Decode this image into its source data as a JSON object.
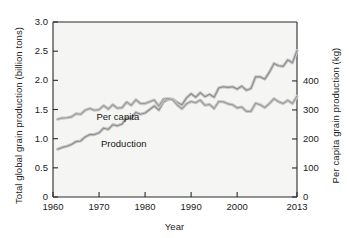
{
  "chart_data": {
    "type": "line",
    "title": "",
    "xlabel": "Year",
    "ylabel": "Total global grain production (billion tons)",
    "ylabel_right": "Per capita grain production (kg)",
    "xlim": [
      1960,
      2013
    ],
    "ylim": [
      0,
      3.0
    ],
    "ylim_right": [
      0,
      603
    ],
    "grid": false,
    "legend_position": "inline-annotation",
    "xticks": [
      1960,
      1970,
      1980,
      1990,
      2000,
      2013
    ],
    "xtick_labels": [
      "1960",
      "1970",
      "1980",
      "1990",
      "2000",
      "2013"
    ],
    "yticks_left": [
      0,
      0.5,
      1.0,
      1.5,
      2.0,
      2.5,
      3.0
    ],
    "ytick_labels_left": [
      "0",
      "0.5",
      "1.0",
      "1.5",
      "2.0",
      "2.5",
      "3.0"
    ],
    "yticks_right": [
      0,
      100,
      200,
      300,
      400
    ],
    "ytick_labels_right": [
      "0",
      "100",
      "200",
      "300",
      "400"
    ],
    "series": [
      {
        "name": "Production",
        "label": "Production",
        "axis": "left",
        "units": "billion tons",
        "color": "#8c8c8c",
        "x": [
          1961,
          1962,
          1963,
          1964,
          1965,
          1966,
          1967,
          1968,
          1969,
          1970,
          1971,
          1972,
          1973,
          1974,
          1975,
          1976,
          1977,
          1978,
          1979,
          1980,
          1981,
          1982,
          1983,
          1984,
          1985,
          1986,
          1987,
          1988,
          1989,
          1990,
          1991,
          1992,
          1993,
          1994,
          1995,
          1996,
          1997,
          1998,
          1999,
          2000,
          2001,
          2002,
          2003,
          2004,
          2005,
          2006,
          2007,
          2008,
          2009,
          2010,
          2011,
          2012,
          2013
        ],
        "values": [
          0.82,
          0.85,
          0.87,
          0.9,
          0.95,
          0.96,
          1.03,
          1.07,
          1.07,
          1.1,
          1.18,
          1.16,
          1.24,
          1.22,
          1.25,
          1.36,
          1.34,
          1.45,
          1.42,
          1.44,
          1.5,
          1.56,
          1.49,
          1.63,
          1.67,
          1.68,
          1.62,
          1.58,
          1.7,
          1.77,
          1.71,
          1.79,
          1.72,
          1.76,
          1.71,
          1.87,
          1.89,
          1.88,
          1.89,
          1.85,
          1.9,
          1.83,
          1.86,
          2.06,
          2.06,
          2.02,
          2.14,
          2.29,
          2.25,
          2.24,
          2.35,
          2.3,
          2.51
        ],
        "final_value": 2.51
      },
      {
        "name": "Per capita",
        "label": "Per capita",
        "axis": "right",
        "units": "kg",
        "color": "#9a9a9a",
        "x": [
          1961,
          1962,
          1963,
          1964,
          1965,
          1966,
          1967,
          1968,
          1969,
          1970,
          1971,
          1972,
          1973,
          1974,
          1975,
          1976,
          1977,
          1978,
          1979,
          1980,
          1981,
          1982,
          1983,
          1984,
          1985,
          1986,
          1987,
          1988,
          1989,
          1990,
          1991,
          1992,
          1993,
          1994,
          1995,
          1996,
          1997,
          1998,
          1999,
          2000,
          2001,
          2002,
          2003,
          2004,
          2005,
          2006,
          2007,
          2008,
          2009,
          2010,
          2011,
          2012,
          2013
        ],
        "values": [
          268,
          272,
          273,
          276,
          287,
          285,
          299,
          305,
          299,
          301,
          315,
          303,
          318,
          306,
          308,
          327,
          316,
          335,
          322,
          322,
          328,
          334,
          313,
          337,
          339,
          335,
          317,
          304,
          321,
          329,
          325,
          334,
          316,
          319,
          305,
          329,
          328,
          321,
          318,
          307,
          310,
          295,
          295,
          323,
          318,
          308,
          322,
          339,
          328,
          322,
          333,
          322,
          347
        ],
        "final_value": 347
      }
    ],
    "annotations": [
      {
        "text": "Per capita",
        "x": 1969,
        "y_right": 278
      },
      {
        "text": "Production",
        "x": 1970,
        "y_left": 0.92
      }
    ]
  },
  "axis_titles": {
    "left": "Total global grain production (billion tons)",
    "right": "Per capita grain production (kg)",
    "bottom": "Year"
  },
  "style": {
    "plot_background": "#f5f5f3",
    "axis_color": "#2b2b2b",
    "text_color": "#1b1b1b",
    "line_color": "#909090"
  }
}
